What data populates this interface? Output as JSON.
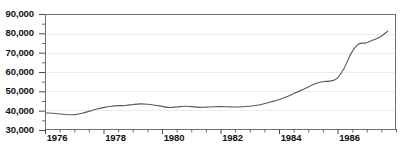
{
  "chart_data": {
    "type": "line",
    "title": "",
    "subtitle": "",
    "xlabel": "",
    "ylabel": "",
    "xlim": [
      1976.0,
      1988.0
    ],
    "ylim": [
      30000,
      90000
    ],
    "grid": true,
    "grid_axis": "y",
    "legend": false,
    "legend_position": "none",
    "y_ticks": [
      30000,
      40000,
      50000,
      60000,
      70000,
      80000,
      90000
    ],
    "y_tick_labels": [
      "30,000",
      "40,000",
      "50,000",
      "60,000",
      "70,000",
      "80,000",
      "90,000"
    ],
    "y_minor_ticks_per_interval": 1,
    "x_ticks": [
      1976,
      1978,
      1980,
      1982,
      1984,
      1986
    ],
    "x_tick_labels": [
      "1976",
      "1978",
      "1980",
      "1982",
      "1984",
      "1986"
    ],
    "x_minor_tick_interval": 0.5,
    "series": [
      {
        "name": "series-1",
        "color": "#5a5a5a",
        "x": [
          1976.0,
          1976.25,
          1976.5,
          1976.75,
          1977.0,
          1977.25,
          1977.5,
          1977.75,
          1978.0,
          1978.25,
          1978.5,
          1978.75,
          1979.0,
          1979.25,
          1979.5,
          1979.75,
          1980.0,
          1980.25,
          1980.5,
          1980.75,
          1981.0,
          1981.25,
          1981.5,
          1981.75,
          1982.0,
          1982.25,
          1982.5,
          1982.75,
          1983.0,
          1983.25,
          1983.5,
          1983.75,
          1984.0,
          1984.25,
          1984.5,
          1984.75,
          1985.0,
          1985.25,
          1985.5,
          1985.75,
          1986.0,
          1986.25,
          1986.5,
          1986.75,
          1987.0,
          1987.25,
          1987.5,
          1987.75
        ],
        "values": [
          38400,
          38300,
          37900,
          37500,
          37600,
          38300,
          39400,
          40500,
          41400,
          42000,
          42300,
          42400,
          42900,
          43200,
          43000,
          42500,
          41900,
          41300,
          41600,
          42000,
          41800,
          41400,
          41500,
          41700,
          41800,
          41700,
          41600,
          41700,
          42000,
          42500,
          43300,
          44300,
          45400,
          46800,
          48500,
          50200,
          52000,
          53800,
          54900,
          55200,
          56500,
          62000,
          70000,
          74700,
          75300,
          76800,
          78600,
          81500
        ]
      }
    ]
  }
}
